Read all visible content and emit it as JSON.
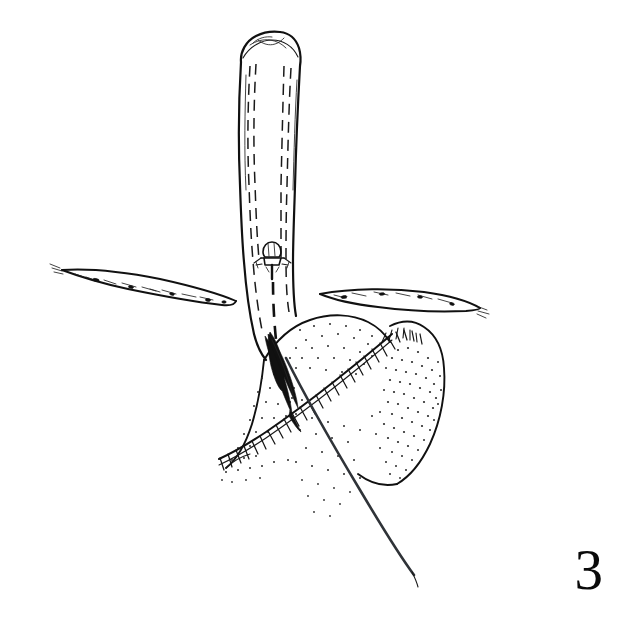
{
  "figure": {
    "number": "3",
    "caption_text": "",
    "background_color": "#ffffff",
    "ink_color": "#111111",
    "width": 621,
    "height": 620,
    "style": "pen-and-ink line drawing"
  },
  "elements": {
    "tube": {
      "name": "tubular-structure",
      "description": "vertical tube with rounded notched tip and dashed inner lumen lines",
      "top_y": 30,
      "bottom_y": 360
    },
    "valve_marker": {
      "name": "valve-marker",
      "description": "small mushroom-shaped structure inside the tube lumen",
      "x": 272,
      "y": 258
    },
    "left_band": {
      "name": "left-tissue-band",
      "description": "thin elongated tapering band extending to the left"
    },
    "right_band": {
      "name": "right-tissue-band",
      "description": "thin elongated tapering band extending to the right"
    },
    "tissue_mass": {
      "name": "stippled-tissue-mass",
      "description": "rounded stippled tissue body below and right of the tube"
    },
    "suture_line": {
      "name": "hatched-suture-line",
      "description": "comb-hatched running suture crossing the tissue mass diagonally"
    },
    "needle": {
      "name": "curved-needle",
      "description": "dark lens-shaped curved surgical needle at the incision"
    },
    "thread": {
      "name": "suture-thread",
      "description": "long straight suture thread trailing to the lower right"
    },
    "incision": {
      "name": "incision-slit",
      "description": "dark narrow slit at the base of the tube"
    }
  }
}
